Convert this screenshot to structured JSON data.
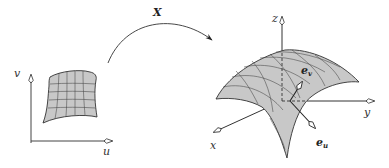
{
  "diagram": {
    "parameter_domain": {
      "axis_u_label": "u",
      "axis_v_label": "v",
      "grid_cells": "5x5"
    },
    "mapping": {
      "label": "X"
    },
    "surface": {
      "axis_x_label": "x",
      "axis_y_label": "y",
      "axis_z_label": "z",
      "tangent_u": {
        "base": "e",
        "sub": "u"
      },
      "tangent_v": {
        "base": "e",
        "sub": "v"
      }
    },
    "colors": {
      "fill": "#c8c8c8",
      "line": "#3a3a3a",
      "background": "#ffffff"
    }
  }
}
